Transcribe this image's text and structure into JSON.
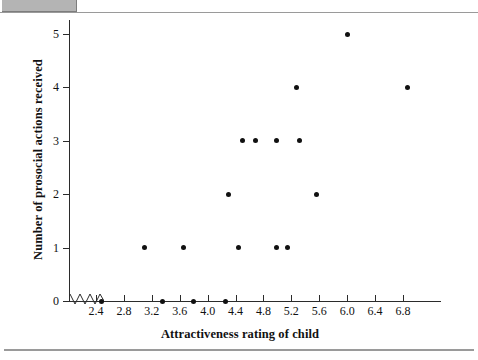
{
  "page": {
    "top_tab_name": "page-corner-tab",
    "top_rule_name": "page-top-rule",
    "bottom_rule_name": "page-bottom-rule"
  },
  "chart_data": {
    "type": "scatter",
    "title": "",
    "xlabel": "Attractiveness rating of child",
    "ylabel": "Number of prosocial actions received",
    "xlim": [
      2.2,
      7.05
    ],
    "ylim": [
      0,
      5
    ],
    "grid": false,
    "legend": null,
    "axis_break": "x-axis-zigzag-break",
    "xticks": [
      2.4,
      2.8,
      3.2,
      3.6,
      4.0,
      4.4,
      4.8,
      5.2,
      5.6,
      6.0,
      6.4,
      6.8
    ],
    "xtick_labels": [
      "2.4",
      "2.8",
      "3.2",
      "3.6",
      "4.0",
      "4.4",
      "4.8",
      "5.2",
      "5.6",
      "6.0",
      "6.4",
      "6.8"
    ],
    "yticks": [
      0,
      1,
      2,
      3,
      4,
      5
    ],
    "ytick_labels": [
      "0",
      "1",
      "2",
      "3",
      "4",
      "5"
    ],
    "marker": "filled-circle",
    "marker_color": "#111111",
    "points": [
      {
        "x": 2.48,
        "y": 0
      },
      {
        "x": 3.35,
        "y": 0
      },
      {
        "x": 3.8,
        "y": 0
      },
      {
        "x": 4.26,
        "y": 0
      },
      {
        "x": 3.1,
        "y": 1
      },
      {
        "x": 3.66,
        "y": 1
      },
      {
        "x": 4.44,
        "y": 1
      },
      {
        "x": 4.98,
        "y": 1
      },
      {
        "x": 5.14,
        "y": 1
      },
      {
        "x": 4.3,
        "y": 2
      },
      {
        "x": 5.56,
        "y": 2
      },
      {
        "x": 4.5,
        "y": 3
      },
      {
        "x": 4.68,
        "y": 3
      },
      {
        "x": 4.98,
        "y": 3
      },
      {
        "x": 5.32,
        "y": 3
      },
      {
        "x": 5.28,
        "y": 4
      },
      {
        "x": 6.86,
        "y": 4
      },
      {
        "x": 6.0,
        "y": 5
      }
    ]
  }
}
